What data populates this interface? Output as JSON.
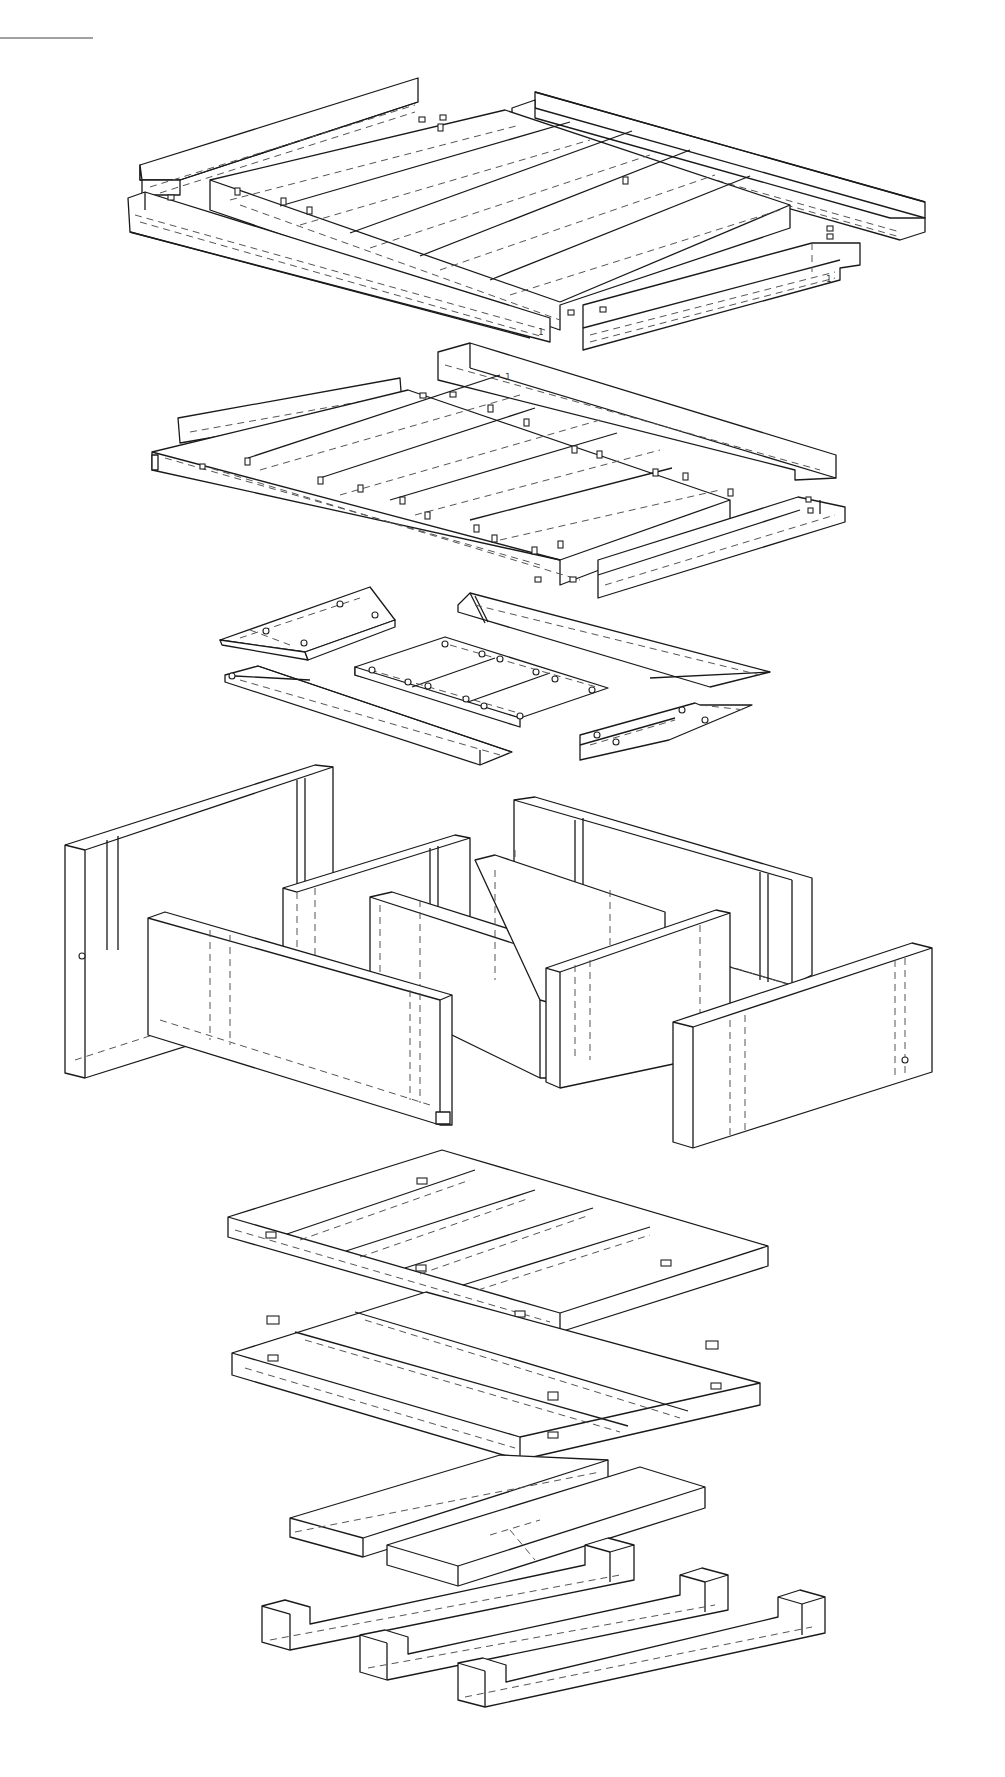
{
  "drawing": {
    "type": "exploded isometric assembly drawing",
    "background": "#ffffff",
    "line_color": "#1a1a1a",
    "corner_rule": {
      "x1": 0,
      "y1": 38,
      "x2": 93,
      "y2": 38
    }
  },
  "groups": [
    {
      "name": "roof-assembly",
      "components": [
        {
          "name": "roof-rail-back-left",
          "pts": [
            [
              140,
              165
            ],
            [
              420,
              78
            ],
            [
              420,
              102
            ],
            [
              180,
              180
            ],
            [
              180,
              195
            ],
            [
              140,
              195
            ]
          ]
        },
        {
          "name": "roof-rail-back-right",
          "pts": [
            [
              512,
              108
            ],
            [
              535,
              92
            ],
            [
              925,
              200
            ],
            [
              925,
              232
            ],
            [
              900,
              240
            ],
            [
              512,
              130
            ]
          ]
        },
        {
          "name": "roof-panel",
          "pts": [
            [
              210,
              180
            ],
            [
              510,
              110
            ],
            [
              790,
              208
            ],
            [
              560,
              302
            ],
            [
              210,
              200
            ]
          ]
        },
        {
          "name": "roof-rail-front-left",
          "pts": [
            [
              128,
              198
            ],
            [
              145,
              192
            ],
            [
              550,
              318
            ],
            [
              550,
              342
            ],
            [
              128,
              230
            ]
          ]
        },
        {
          "name": "roof-rail-front-right",
          "pts": [
            [
              583,
              302
            ],
            [
              818,
              242
            ],
            [
              860,
              242
            ],
            [
              860,
              265
            ],
            [
              583,
              350
            ]
          ]
        }
      ],
      "slats": 5,
      "label_marks": [
        "1",
        "1",
        "1"
      ]
    },
    {
      "name": "upper-frame-assembly",
      "components": [
        {
          "name": "frame-rail-back-left",
          "pts": [
            [
              180,
              415
            ],
            [
              400,
              378
            ],
            [
              400,
              405
            ],
            [
              180,
              440
            ]
          ]
        },
        {
          "name": "frame-rail-back-right",
          "pts": [
            [
              438,
              352
            ],
            [
              470,
              340
            ],
            [
              830,
              453
            ],
            [
              830,
              480
            ],
            [
              790,
              478
            ],
            [
              438,
              380
            ]
          ]
        },
        {
          "name": "frame-panel",
          "pts": [
            [
              155,
              455
            ],
            [
              410,
              380
            ],
            [
              730,
              492
            ],
            [
              560,
              560
            ],
            [
              155,
              470
            ]
          ]
        },
        {
          "name": "frame-rail-front-right",
          "pts": [
            [
              598,
              555
            ],
            [
              798,
              490
            ],
            [
              845,
              505
            ],
            [
              845,
              520
            ],
            [
              598,
              595
            ]
          ]
        }
      ],
      "slats": 5
    },
    {
      "name": "shelf-parts",
      "components": [
        {
          "name": "bracket-left-upper",
          "pts": [
            [
              220,
              640
            ],
            [
              370,
              587
            ],
            [
              415,
              622
            ],
            [
              305,
              660
            ]
          ]
        },
        {
          "name": "strip-right-upper",
          "pts": [
            [
              458,
              605
            ],
            [
              477,
              593
            ],
            [
              770,
              672
            ],
            [
              710,
              692
            ],
            [
              458,
              615
            ]
          ]
        },
        {
          "name": "shelf-tray",
          "pts": [
            [
              375,
              667
            ],
            [
              463,
              637
            ],
            [
              653,
              687
            ],
            [
              530,
              728
            ],
            [
              375,
              680
            ]
          ]
        },
        {
          "name": "strip-left-lower",
          "pts": [
            [
              225,
              675
            ],
            [
              258,
              666
            ],
            [
              545,
              750
            ],
            [
              480,
              765
            ],
            [
              225,
              685
            ]
          ]
        },
        {
          "name": "bracket-right-lower",
          "pts": [
            [
              585,
              734
            ],
            [
              705,
              703
            ],
            [
              752,
              705
            ],
            [
              669,
              740
            ],
            [
              585,
              762
            ]
          ]
        }
      ],
      "connectors": 12
    },
    {
      "name": "wall-panels",
      "components": [
        {
          "name": "wall-back-left",
          "pts": [
            [
              65,
              842
            ],
            [
              315,
              760
            ],
            [
              335,
              765
            ],
            [
              335,
              1000
            ],
            [
              85,
              1082
            ],
            [
              65,
              1075
            ]
          ]
        },
        {
          "name": "wall-back-right",
          "pts": [
            [
              514,
              800
            ],
            [
              535,
              797
            ],
            [
              812,
              880
            ],
            [
              812,
              1000
            ],
            [
              792,
              995
            ],
            [
              514,
              955
            ]
          ]
        },
        {
          "name": "wall-mid-left",
          "pts": [
            [
              290,
              890
            ],
            [
              455,
              835
            ],
            [
              470,
              840
            ],
            [
              470,
              1000
            ],
            [
              290,
              990
            ]
          ]
        },
        {
          "name": "wall-mid-center",
          "pts": [
            [
              370,
              897
            ],
            [
              392,
              893
            ],
            [
              560,
              945
            ],
            [
              560,
              1080
            ],
            [
              540,
              1080
            ],
            [
              370,
              990
            ]
          ]
        },
        {
          "name": "wall-mid-right",
          "pts": [
            [
              475,
              860
            ],
            [
              495,
              855
            ],
            [
              675,
              920
            ],
            [
              675,
              1040
            ],
            [
              490,
              990
            ]
          ]
        },
        {
          "name": "wall-front-left",
          "pts": [
            [
              150,
              915
            ],
            [
              170,
              910
            ],
            [
              450,
              995
            ],
            [
              450,
              1125
            ],
            [
              430,
              1125
            ],
            [
              150,
              1030
            ]
          ]
        },
        {
          "name": "wall-front-center",
          "pts": [
            [
              548,
              965
            ],
            [
              720,
              905
            ],
            [
              730,
              910
            ],
            [
              730,
              1055
            ],
            [
              560,
              1085
            ],
            [
              548,
              1080
            ]
          ]
        },
        {
          "name": "wall-front-right",
          "pts": [
            [
              675,
              1020
            ],
            [
              915,
              940
            ],
            [
              935,
              945
            ],
            [
              935,
              1075
            ],
            [
              695,
              1150
            ],
            [
              675,
              1145
            ]
          ]
        }
      ]
    },
    {
      "name": "floor-assembly",
      "components": [
        {
          "name": "floor-upper-panel",
          "pts": [
            [
              230,
              1210
            ],
            [
              442,
              1150
            ],
            [
              767,
              1255
            ],
            [
              555,
              1332
            ],
            [
              230,
              1245
            ]
          ]
        },
        {
          "name": "floor-lower-panel",
          "pts": [
            [
              235,
              1353
            ],
            [
              430,
              1290
            ],
            [
              760,
              1400
            ],
            [
              560,
              1462
            ],
            [
              235,
              1375
            ]
          ]
        }
      ],
      "slats": 4,
      "loose_connectors": [
        [
          275,
          1320
        ],
        [
          715,
          1347
        ]
      ]
    },
    {
      "name": "base-assembly",
      "components": [
        {
          "name": "base-beam-upper",
          "pts": [
            [
              290,
              1518
            ],
            [
              500,
              1455
            ],
            [
              606,
              1460
            ],
            [
              606,
              1480
            ],
            [
              363,
              1557
            ],
            [
              290,
              1537
            ]
          ]
        },
        {
          "name": "base-beam-lower",
          "pts": [
            [
              387,
              1545
            ],
            [
              640,
              1467
            ],
            [
              705,
              1488
            ],
            [
              705,
              1507
            ],
            [
              458,
              1586
            ],
            [
              387,
              1565
            ]
          ]
        },
        {
          "name": "runner-1",
          "pts": [
            [
              262,
              1606
            ],
            [
              285,
              1600
            ],
            [
              310,
              1608
            ],
            [
              390,
              1580
            ],
            [
              588,
              1562
            ],
            [
              635,
              1565
            ],
            [
              635,
              1600
            ],
            [
              290,
              1650
            ],
            [
              262,
              1641
            ]
          ]
        },
        {
          "name": "runner-2",
          "pts": [
            [
              360,
              1636
            ],
            [
              385,
              1630
            ],
            [
              410,
              1636
            ],
            [
              490,
              1607
            ],
            [
              685,
              1598
            ],
            [
              732,
              1600
            ],
            [
              732,
              1633
            ],
            [
              387,
              1680
            ],
            [
              360,
              1672
            ]
          ]
        },
        {
          "name": "runner-3",
          "pts": [
            [
              458,
              1665
            ],
            [
              483,
              1659
            ],
            [
              508,
              1666
            ],
            [
              590,
              1637
            ],
            [
              780,
              1627
            ],
            [
              730,
              1622
            ],
            [
              730,
              1662
            ],
            [
              485,
              1707
            ],
            [
              458,
              1700
            ]
          ]
        }
      ]
    }
  ]
}
